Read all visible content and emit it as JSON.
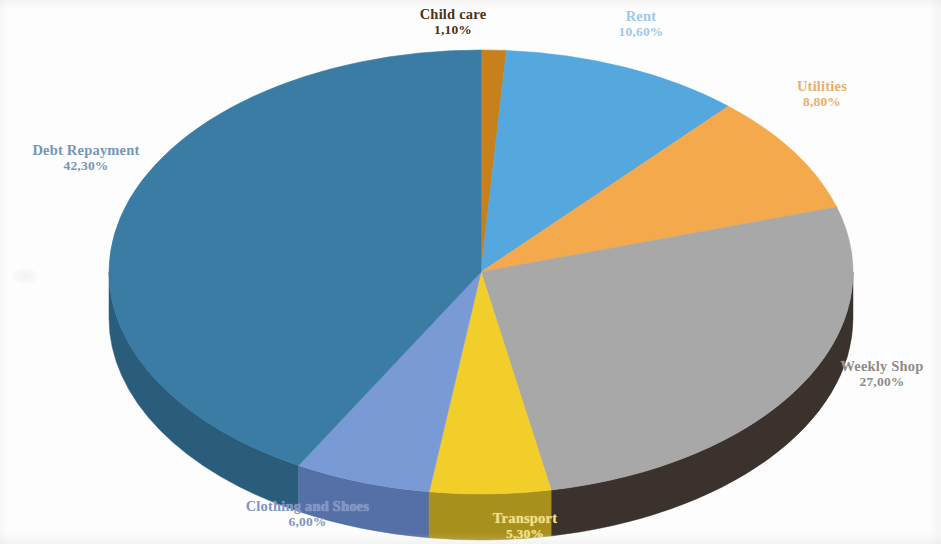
{
  "chart_data": {
    "type": "pie",
    "title": "",
    "subtitle": "",
    "style": "3d-exploded-none",
    "legend_position": "none",
    "labels_outside": true,
    "value_format": "comma-decimal-percent",
    "categories": [
      "Child care",
      "Rent",
      "Utilities",
      "Weekly Shop",
      "Transport",
      "Clothing and Shoes",
      "Debt Repayment"
    ],
    "values": [
      1.1,
      10.6,
      8.8,
      27.0,
      5.3,
      6.0,
      42.3
    ],
    "value_labels": [
      "1,10%",
      "10,60%",
      "8,80%",
      "27,00%",
      "5,30%",
      "6,00%",
      "42,30%"
    ],
    "colors": [
      "#C8801E",
      "#54A8DE",
      "#F5A94E",
      "#A8A8A8",
      "#F2CE2B",
      "#7A9AD6",
      "#3A7CA5"
    ],
    "side_colors": [
      "#8C5612",
      "#3B78A0",
      "#C07A2B",
      "#3B332E",
      "#A8901A",
      "#5470A6",
      "#2B5C7C"
    ],
    "start_angle_deg": 0,
    "direction": "clockwise",
    "total": 101.1
  },
  "slices": [
    {
      "name": "Child care",
      "value_label": "1,10%",
      "percent": 1.1,
      "color": "#C8801E",
      "side_color": "#8C5612",
      "label_color": "#4b3216"
    },
    {
      "name": "Rent",
      "value_label": "10,60%",
      "percent": 10.6,
      "color": "#54A8DE",
      "side_color": "#3B78A0",
      "label_color": "#9ec9e8"
    },
    {
      "name": "Utilities",
      "value_label": "8,80%",
      "percent": 8.8,
      "color": "#F5A94E",
      "side_color": "#C07A2B",
      "label_color": "#e8b06a"
    },
    {
      "name": "Weekly Shop",
      "value_label": "27,00%",
      "percent": 27.0,
      "color": "#A8A8A8",
      "side_color": "#3B332E",
      "label_color": "#8c8c8c"
    },
    {
      "name": "Transport",
      "value_label": "5,30%",
      "percent": 5.3,
      "color": "#F2CE2B",
      "side_color": "#A8901A",
      "label_color": "#f2e07a"
    },
    {
      "name": "Clothing and Shoes",
      "value_label": "6,00%",
      "percent": 6.0,
      "color": "#7A9AD6",
      "side_color": "#5470A6",
      "label_color": "#7d94c4"
    },
    {
      "name": "Debt Repayment",
      "value_label": "42,30%",
      "percent": 42.3,
      "color": "#3A7CA5",
      "side_color": "#2B5C7C",
      "label_color": "#7496b8"
    }
  ],
  "geometry": {
    "center_x": 481,
    "center_y": 272,
    "radius_x": 372,
    "radius_y": 222,
    "depth": 46
  }
}
